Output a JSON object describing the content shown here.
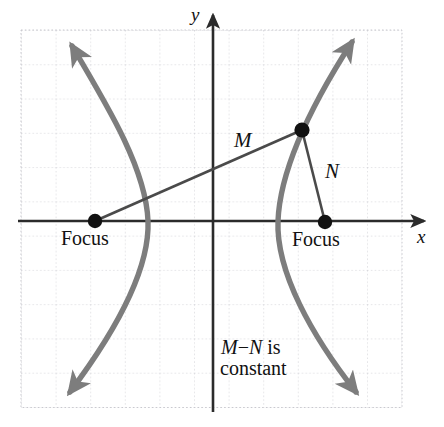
{
  "figure": {
    "axis_labels": {
      "x": "x",
      "y": "y"
    },
    "point_labels": {
      "focus_left": "Focus",
      "focus_right": "Focus",
      "segment_m": "M",
      "segment_n": "N"
    },
    "note_line1": "M−N is",
    "note_line2": "constant",
    "colors": {
      "curve": "#7d7d7d",
      "axis": "#2b2b2b",
      "grid": "#c9c9cf",
      "dot": "#111111",
      "segment": "#4a4a4a",
      "background": "#ffffff"
    }
  },
  "chart_data": {
    "type": "line",
    "xlabel": "x",
    "ylabel": "y",
    "grid": true,
    "legend": "none",
    "axis_origin_px": {
      "x": 213,
      "y": 221
    },
    "grid_spacing_px": 34.6,
    "grid_extent_px": {
      "x0": 21,
      "y0": 30,
      "x1": 402,
      "y1": 407
    },
    "annotations": [
      {
        "text": "Focus",
        "px": [
          95,
          238
        ]
      },
      {
        "text": "Focus",
        "px": [
          327,
          240
        ]
      },
      {
        "text": "M",
        "px": [
          241,
          141
        ]
      },
      {
        "text": "N",
        "px": [
          331,
          172
        ]
      },
      {
        "text": "M−N is",
        "px": [
          253,
          348
        ]
      },
      {
        "text": "constant",
        "px": [
          253,
          369
        ]
      },
      {
        "text": "y",
        "px": [
          197,
          15
        ]
      },
      {
        "text": "x",
        "px": [
          423,
          238
        ]
      }
    ],
    "points": [
      {
        "name": "focus-left",
        "px": [
          95,
          221
        ]
      },
      {
        "name": "focus-right",
        "px": [
          325,
          222
        ]
      },
      {
        "name": "point-on-curve",
        "px": [
          302,
          130
        ]
      },
      {
        "name": "vertex-left",
        "px": [
          148,
          221
        ]
      },
      {
        "name": "vertex-right",
        "px": [
          278,
          221
        ]
      }
    ],
    "series": [
      {
        "name": "left-branch",
        "path": "M 72 46 C 110 110 146 170 148 221 C 150 272 112 336 70 392"
      },
      {
        "name": "right-branch",
        "path": "M 352 42 C 312 104 280 170 278 221 C 276 272 312 336 356 392"
      },
      {
        "name": "segment-M",
        "path": "M 95 221 L 302 130"
      },
      {
        "name": "segment-N",
        "path": "M 325 222 L 302 130"
      }
    ]
  }
}
